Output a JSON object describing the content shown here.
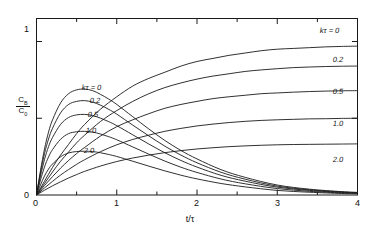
{
  "figure": {
    "background": "#ffffff",
    "line_color": "#1a1a1a",
    "axis_color": "#1a1a1a"
  },
  "axes": {
    "x": {
      "label": "t/τ",
      "ticks": [
        0,
        1,
        2,
        3,
        4
      ],
      "tick_labels": [
        "0",
        "1",
        "2",
        "3",
        "4"
      ],
      "minor_step": 0.5,
      "range": [
        0,
        4
      ]
    },
    "y": {
      "label_numerator": "C",
      "label_numerator_sub": "B",
      "label_denominator": "C",
      "label_denominator_sub": "0",
      "ticks": [
        0,
        0.5,
        1
      ],
      "tick_labels": [
        "0",
        "",
        "1"
      ],
      "visible_tick_labels": [
        "0",
        "1"
      ],
      "range": [
        0,
        1.15
      ]
    }
  },
  "labels": {
    "left_group": [
      {
        "text": "kτ = 0",
        "x": 82,
        "y": 83
      },
      {
        "text": "0.2",
        "x": 90,
        "y": 96
      },
      {
        "text": "0.5",
        "x": 88,
        "y": 110
      },
      {
        "text": "1.0",
        "x": 86,
        "y": 126
      },
      {
        "text": "2.0",
        "x": 84,
        "y": 146
      }
    ],
    "right_group": [
      {
        "text": "kτ = 0",
        "x": 320,
        "y": 26
      },
      {
        "text": "0.2",
        "x": 333,
        "y": 55
      },
      {
        "text": "0.5",
        "x": 333,
        "y": 87
      },
      {
        "text": "1.0",
        "x": 333,
        "y": 119
      },
      {
        "text": "2.0",
        "x": 333,
        "y": 155
      }
    ]
  },
  "chart_data": {
    "type": "line",
    "title": "",
    "xlabel": "t/τ",
    "ylabel": "C_B / C_0",
    "xlim": [
      0,
      4
    ],
    "ylim": [
      0,
      1.15
    ],
    "grid": false,
    "legend": "inline-curve-labels",
    "parameter_name": "kτ",
    "parameter_values": [
      0,
      0.2,
      0.5,
      1.0,
      2.0
    ],
    "families": [
      {
        "name": "rising",
        "description": "saturating curves approaching plateau, labeled at right",
        "series": [
          {
            "name": "kτ = 0",
            "plateau": 0.97,
            "x": [
              0,
              0.1,
              0.2,
              0.3,
              0.4,
              0.5,
              0.6,
              0.8,
              1.0,
              1.2,
              1.4,
              1.6,
              1.8,
              2.0,
              2.2,
              2.4,
              2.6,
              2.8,
              3.0,
              3.2,
              3.4,
              3.6,
              3.8,
              4.0
            ],
            "y": [
              0,
              0.09,
              0.18,
              0.26,
              0.33,
              0.4,
              0.46,
              0.56,
              0.64,
              0.71,
              0.76,
              0.8,
              0.84,
              0.87,
              0.89,
              0.91,
              0.925,
              0.94,
              0.95,
              0.955,
              0.96,
              0.965,
              0.968,
              0.97
            ]
          },
          {
            "name": "0.2",
            "plateau": 0.84,
            "x": [
              0,
              0.1,
              0.2,
              0.3,
              0.4,
              0.5,
              0.6,
              0.8,
              1.0,
              1.2,
              1.4,
              1.6,
              1.8,
              2.0,
              2.2,
              2.4,
              2.6,
              2.8,
              3.0,
              3.2,
              3.4,
              3.6,
              3.8,
              4.0
            ],
            "y": [
              0,
              0.075,
              0.15,
              0.22,
              0.28,
              0.34,
              0.39,
              0.48,
              0.55,
              0.61,
              0.66,
              0.7,
              0.73,
              0.755,
              0.775,
              0.79,
              0.805,
              0.815,
              0.823,
              0.83,
              0.834,
              0.837,
              0.839,
              0.84
            ]
          },
          {
            "name": "0.5",
            "plateau": 0.68,
            "x": [
              0,
              0.1,
              0.2,
              0.3,
              0.4,
              0.5,
              0.6,
              0.8,
              1.0,
              1.2,
              1.4,
              1.6,
              1.8,
              2.0,
              2.2,
              2.4,
              2.6,
              2.8,
              3.0,
              3.2,
              3.4,
              3.6,
              3.8,
              4.0
            ],
            "y": [
              0,
              0.062,
              0.12,
              0.175,
              0.225,
              0.27,
              0.31,
              0.385,
              0.445,
              0.49,
              0.53,
              0.565,
              0.59,
              0.61,
              0.628,
              0.64,
              0.65,
              0.66,
              0.665,
              0.67,
              0.674,
              0.677,
              0.679,
              0.68
            ]
          },
          {
            "name": "1.0",
            "plateau": 0.5,
            "x": [
              0,
              0.1,
              0.2,
              0.3,
              0.4,
              0.5,
              0.6,
              0.8,
              1.0,
              1.2,
              1.4,
              1.6,
              1.8,
              2.0,
              2.2,
              2.4,
              2.6,
              2.8,
              3.0,
              3.2,
              3.4,
              3.6,
              3.8,
              4.0
            ],
            "y": [
              0,
              0.046,
              0.089,
              0.13,
              0.166,
              0.2,
              0.23,
              0.283,
              0.327,
              0.362,
              0.39,
              0.415,
              0.434,
              0.45,
              0.462,
              0.472,
              0.48,
              0.486,
              0.49,
              0.493,
              0.496,
              0.497,
              0.499,
              0.5
            ]
          },
          {
            "name": "2.0",
            "plateau": 0.333,
            "x": [
              0,
              0.1,
              0.2,
              0.3,
              0.4,
              0.5,
              0.6,
              0.8,
              1.0,
              1.2,
              1.4,
              1.6,
              1.8,
              2.0,
              2.2,
              2.4,
              2.6,
              2.8,
              3.0,
              3.2,
              3.4,
              3.6,
              3.8,
              4.0
            ],
            "y": [
              0,
              0.031,
              0.06,
              0.086,
              0.111,
              0.133,
              0.154,
              0.189,
              0.218,
              0.241,
              0.26,
              0.276,
              0.289,
              0.3,
              0.308,
              0.315,
              0.32,
              0.324,
              0.327,
              0.329,
              0.33,
              0.331,
              0.332,
              0.333
            ]
          }
        ]
      },
      {
        "name": "peaked",
        "description": "rise-then-decay curves, labeled at left near peaks",
        "series": [
          {
            "name": "kτ = 0",
            "peak_x": 0.6,
            "peak_y": 0.69,
            "x": [
              0,
              0.05,
              0.1,
              0.15,
              0.2,
              0.3,
              0.4,
              0.5,
              0.6,
              0.7,
              0.8,
              0.9,
              1.0,
              1.2,
              1.4,
              1.6,
              1.8,
              2.0,
              2.3,
              2.6,
              3.0,
              3.4,
              3.8,
              4.0
            ],
            "y": [
              0,
              0.16,
              0.3,
              0.41,
              0.49,
              0.6,
              0.66,
              0.685,
              0.69,
              0.68,
              0.655,
              0.625,
              0.59,
              0.51,
              0.43,
              0.355,
              0.29,
              0.235,
              0.165,
              0.115,
              0.065,
              0.038,
              0.022,
              0.017
            ]
          },
          {
            "name": "0.2",
            "peak_x": 0.62,
            "peak_y": 0.615,
            "x": [
              0,
              0.05,
              0.1,
              0.15,
              0.2,
              0.3,
              0.4,
              0.5,
              0.6,
              0.7,
              0.8,
              0.9,
              1.0,
              1.2,
              1.4,
              1.6,
              1.8,
              2.0,
              2.3,
              2.6,
              3.0,
              3.4,
              3.8,
              4.0
            ],
            "y": [
              0,
              0.145,
              0.27,
              0.365,
              0.435,
              0.535,
              0.59,
              0.61,
              0.615,
              0.605,
              0.585,
              0.558,
              0.527,
              0.455,
              0.385,
              0.318,
              0.26,
              0.21,
              0.148,
              0.103,
              0.058,
              0.034,
              0.02,
              0.015
            ]
          },
          {
            "name": "0.5",
            "peak_x": 0.65,
            "peak_y": 0.525,
            "x": [
              0,
              0.05,
              0.1,
              0.15,
              0.2,
              0.3,
              0.4,
              0.5,
              0.6,
              0.7,
              0.8,
              0.9,
              1.0,
              1.2,
              1.4,
              1.6,
              1.8,
              2.0,
              2.3,
              2.6,
              3.0,
              3.4,
              3.8,
              4.0
            ],
            "y": [
              0,
              0.125,
              0.232,
              0.315,
              0.375,
              0.46,
              0.505,
              0.522,
              0.525,
              0.518,
              0.5,
              0.478,
              0.452,
              0.392,
              0.332,
              0.275,
              0.225,
              0.182,
              0.128,
              0.09,
              0.051,
              0.03,
              0.017,
              0.013
            ]
          },
          {
            "name": "1.0",
            "peak_x": 0.68,
            "peak_y": 0.415,
            "x": [
              0,
              0.05,
              0.1,
              0.15,
              0.2,
              0.3,
              0.4,
              0.5,
              0.6,
              0.7,
              0.8,
              0.9,
              1.0,
              1.2,
              1.4,
              1.6,
              1.8,
              2.0,
              2.3,
              2.6,
              3.0,
              3.4,
              3.8,
              4.0
            ],
            "y": [
              0,
              0.098,
              0.183,
              0.248,
              0.296,
              0.363,
              0.4,
              0.412,
              0.415,
              0.41,
              0.397,
              0.38,
              0.36,
              0.313,
              0.266,
              0.221,
              0.181,
              0.147,
              0.104,
              0.073,
              0.042,
              0.024,
              0.014,
              0.011
            ]
          },
          {
            "name": "2.0",
            "peak_x": 0.72,
            "peak_y": 0.285,
            "x": [
              0,
              0.05,
              0.1,
              0.15,
              0.2,
              0.3,
              0.4,
              0.5,
              0.6,
              0.7,
              0.8,
              0.9,
              1.0,
              1.2,
              1.4,
              1.6,
              1.8,
              2.0,
              2.3,
              2.6,
              3.0,
              3.4,
              3.8,
              4.0
            ],
            "y": [
              0,
              0.066,
              0.124,
              0.169,
              0.202,
              0.249,
              0.274,
              0.283,
              0.285,
              0.283,
              0.275,
              0.264,
              0.251,
              0.22,
              0.188,
              0.157,
              0.129,
              0.105,
              0.075,
              0.053,
              0.03,
              0.018,
              0.01,
              0.008
            ]
          }
        ]
      }
    ]
  }
}
